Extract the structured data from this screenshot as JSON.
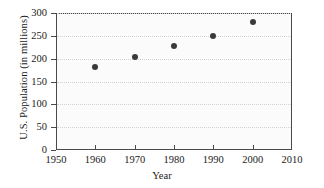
{
  "chart_data": {
    "type": "scatter",
    "title": "",
    "xlabel": "Year",
    "ylabel": "U.S. Population (in millions)",
    "x": [
      1960,
      1970,
      1980,
      1990,
      2000
    ],
    "values": [
      181,
      203,
      227,
      250,
      281
    ],
    "series": [
      {
        "name": "U.S. Population",
        "values": [
          181,
          203,
          227,
          250,
          281
        ]
      }
    ],
    "xlim": [
      1950,
      2010
    ],
    "ylim": [
      0,
      300
    ],
    "xticks": [
      1950,
      1960,
      1970,
      1980,
      1990,
      2000,
      2010
    ],
    "yticks": [
      0,
      50,
      100,
      150,
      200,
      250,
      300
    ],
    "xtick_labels": [
      "1950",
      "1960",
      "1970",
      "1980",
      "1990",
      "2000",
      "2010"
    ],
    "ytick_labels": [
      "0",
      "50",
      "100",
      "150",
      "200",
      "250",
      "300"
    ],
    "grid": "horizontal-dotted",
    "legend": "none",
    "marker_color": "#3a3a3a",
    "axis_color": "#4a4a4a",
    "grid_color": "#d2d2d2",
    "plot_background": "#fbfbfb"
  }
}
